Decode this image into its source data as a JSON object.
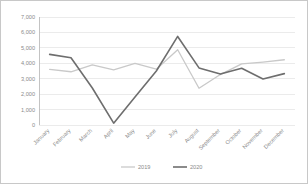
{
  "chart_data": {
    "type": "line",
    "title": "",
    "xlabel": "",
    "ylabel": "",
    "ylim": [
      0,
      7000
    ],
    "yticks": [
      0,
      1000,
      2000,
      3000,
      4000,
      5000,
      6000,
      7000
    ],
    "ytick_labels": [
      "0",
      "1,000",
      "2,000",
      "3,000",
      "4,000",
      "5,000",
      "6,000",
      "7,000"
    ],
    "grid": true,
    "grid_axis": "y",
    "legend_position": "bottom",
    "categories": [
      "January",
      "February",
      "March",
      "April",
      "May",
      "June",
      "July",
      "August",
      "September",
      "October",
      "November",
      "December"
    ],
    "series": [
      {
        "name": "2019",
        "color": "#c9c9c9",
        "width": 1.3,
        "values": [
          3600,
          3450,
          3900,
          3570,
          4000,
          3620,
          4880,
          2380,
          3270,
          3960,
          4080,
          4230
        ]
      },
      {
        "name": "2020",
        "color": "#6e6e6e",
        "width": 1.6,
        "values": [
          4580,
          4360,
          2400,
          120,
          1820,
          3500,
          5740,
          3700,
          3300,
          3680,
          2980,
          3330
        ]
      }
    ]
  },
  "legend": {
    "entries": [
      {
        "label": "2019"
      },
      {
        "label": "2020"
      }
    ]
  },
  "axes": {
    "y_axis_name": "value-axis",
    "x_axis_name": "month-axis"
  }
}
